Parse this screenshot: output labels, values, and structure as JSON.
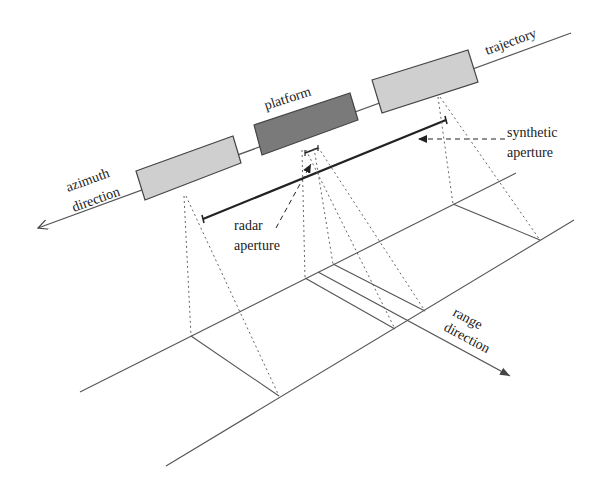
{
  "labels": {
    "trajectory": "trajectory",
    "platform": "platform",
    "synthetic_aperture_line1": "synthetic",
    "synthetic_aperture_line2": "aperture",
    "azimuth_line1": "azimuth",
    "azimuth_line2": "direction",
    "radar_aperture_line1": "radar",
    "radar_aperture_line2": "aperture",
    "range_line1": "range",
    "range_line2": "direction"
  },
  "colors": {
    "platform_active": "#7a7a7a",
    "platform_inactive": "#cfcfcf",
    "stroke": "#444444",
    "aperture_bar": "#222222"
  }
}
